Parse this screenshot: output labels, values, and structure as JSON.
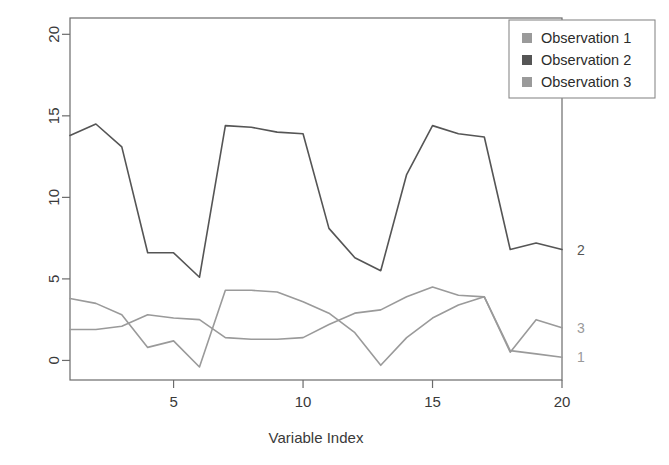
{
  "chart_data": {
    "type": "line",
    "title": "",
    "xlabel": "Variable Index",
    "ylabel": "",
    "xlim": [
      1,
      20
    ],
    "ylim": [
      -1.2,
      21.0
    ],
    "grid": false,
    "legend_position": "top-right",
    "x": [
      1,
      2,
      3,
      4,
      5,
      6,
      7,
      8,
      9,
      10,
      11,
      12,
      13,
      14,
      15,
      16,
      17,
      18,
      19,
      20
    ],
    "xticks": [
      5,
      10,
      15,
      20
    ],
    "xtick_labels": [
      "5",
      "10",
      "15",
      "20"
    ],
    "yticks": [
      0,
      5,
      10,
      15,
      20
    ],
    "ytick_labels": [
      "0",
      "5",
      "10",
      "15",
      "20"
    ],
    "series": [
      {
        "name": "Observation 1",
        "end_label": "1",
        "color": "#9a9a9a",
        "values": [
          1.9,
          1.9,
          2.1,
          2.8,
          2.6,
          2.5,
          1.4,
          1.3,
          1.3,
          1.4,
          2.2,
          2.9,
          3.1,
          3.9,
          4.5,
          4.0,
          3.9,
          0.6,
          0.4,
          0.2
        ]
      },
      {
        "name": "Observation 2",
        "end_label": "2",
        "color": "#555555",
        "values": [
          13.8,
          14.5,
          13.1,
          6.6,
          6.6,
          5.1,
          14.4,
          14.3,
          14.0,
          13.9,
          8.1,
          6.3,
          5.5,
          11.4,
          14.4,
          13.9,
          13.7,
          6.8,
          7.2,
          6.8
        ]
      },
      {
        "name": "Observation 3",
        "end_label": "3",
        "color": "#9a9a9a",
        "values": [
          3.8,
          3.5,
          2.8,
          0.8,
          1.2,
          -0.4,
          4.3,
          4.3,
          4.2,
          3.6,
          2.9,
          1.7,
          -0.3,
          1.4,
          2.6,
          3.4,
          3.9,
          0.5,
          2.5,
          2.0
        ]
      }
    ]
  },
  "legend": {
    "items": [
      {
        "label": "Observation 1",
        "swatch_color": "#9a9a9a"
      },
      {
        "label": "Observation 2",
        "swatch_color": "#555555"
      },
      {
        "label": "Observation 3",
        "swatch_color": "#9a9a9a"
      }
    ]
  },
  "axes": {
    "x_title": "Variable Index",
    "frame_color": "#6b6b6b"
  }
}
